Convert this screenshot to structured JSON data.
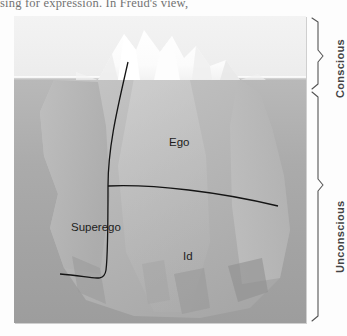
{
  "page": {
    "cutoff_body_text": "sing for expression. In Freud's view,"
  },
  "figure": {
    "name": "freud-iceberg-model",
    "regions": [
      {
        "id": "ego",
        "label": "Ego"
      },
      {
        "id": "superego",
        "label": "Superego"
      },
      {
        "id": "id",
        "label": "Id"
      }
    ],
    "brackets": [
      {
        "id": "conscious",
        "label": "Conscious"
      },
      {
        "id": "unconscious",
        "label": "Unconscious"
      }
    ],
    "colors": {
      "sky": "#f0f0f0",
      "sea": "#a9a9a9",
      "ice_above_water": "#ffffff",
      "ice_below_water": "#b4b4b4",
      "divider_line": "#151515",
      "bracket_line": "#555555",
      "label_text": "#1d1d1d",
      "side_label_text": "#444444"
    }
  }
}
